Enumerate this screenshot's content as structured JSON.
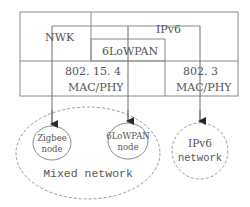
{
  "diagram": {
    "stack": {
      "nwk_label": "NWK",
      "ipv6_label": "IPv6",
      "sixlowpan_label": "6LoWPAN",
      "ieee802154": {
        "line1": "802. 15. 4",
        "line2": "MAC/PHY"
      },
      "ieee8023": {
        "line1": "802. 3",
        "line2": "MAC/PHY"
      }
    },
    "nodes": {
      "zigbee": {
        "line1": "Zigbee",
        "line2": "node"
      },
      "sixlowpan": {
        "line1": "6LoWPAN",
        "line2": "node"
      },
      "ipv6_network": {
        "line1": "IPv6",
        "line2": "network"
      }
    },
    "mixed_network_label": "Mixed network",
    "colors": {
      "line": "#8a8a8a",
      "solid_line": "#6f6f6f",
      "arrow": "#2a2a2a",
      "text": "#555555"
    }
  }
}
